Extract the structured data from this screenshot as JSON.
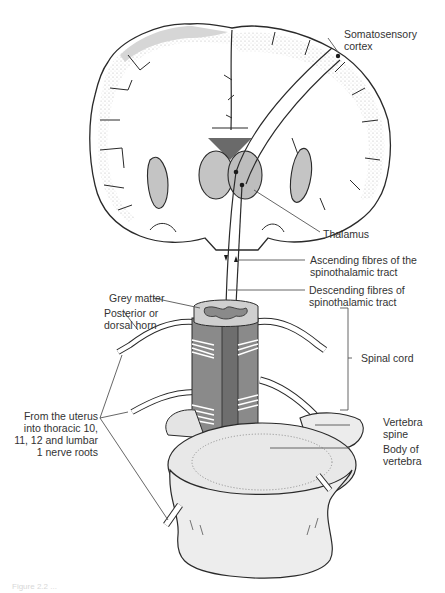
{
  "figure": {
    "caption": "Figure 2.2 ...",
    "colors": {
      "outline": "#2a2a2a",
      "grey_matter": "#cfcfcf",
      "thalamus": "#bdbdbd",
      "cord_tract": "#6e6e6e",
      "cord_side": "#8a8a8a",
      "vertebra": "#ececec",
      "stipple": "#9a9a9a",
      "leader_line": "#555555",
      "label_text": "#333333"
    },
    "labels": {
      "somatosensory_cortex": "Somatosensory\ncortex",
      "thalamus": "Thalamus",
      "ascending_fibres": "Ascending fibres of the\nspinothalamic tract",
      "descending_fibres": "Descending fibres of\nspinothalamic tract",
      "grey_matter": "Grey matter",
      "posterior_horn": "Posterior or\ndorsal horn",
      "spinal_cord": "Spinal cord",
      "uterus_nerve_roots": "From the uterus\ninto thoracic 10,\n11, 12 and lumbar\n1 nerve roots",
      "vertebra_spine": "Vertebra\nspine",
      "body_of_vertebra": "Body of\nvertebra"
    },
    "icons": {
      "brain": "brain-coronal-section-icon",
      "spinal_cord": "spinal-cord-segment-icon",
      "vertebra": "vertebra-icon"
    }
  }
}
